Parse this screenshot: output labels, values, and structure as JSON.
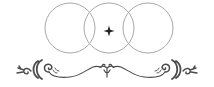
{
  "ornament": {
    "title": "Decorative divider ornament",
    "background_color": "#ffffff",
    "circles": {
      "stroke_color": "#a8a8a8",
      "stroke_width": 1,
      "items": [
        {
          "cx": 70,
          "cy": 28,
          "r": 25
        },
        {
          "cx": 109,
          "cy": 28,
          "r": 25
        },
        {
          "cx": 148,
          "cy": 28,
          "r": 25
        }
      ]
    },
    "star": {
      "cx": 109,
      "cy": 31,
      "size": 5,
      "color": "#222222"
    },
    "flourish": {
      "color": "#4a4a4a"
    }
  }
}
